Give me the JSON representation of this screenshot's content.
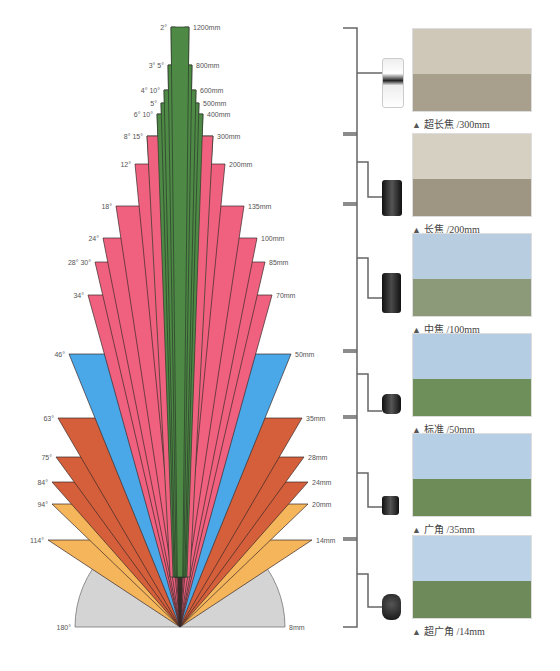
{
  "chart_data": {
    "type": "diagram",
    "origin": [
      180,
      627
    ],
    "groups": [
      {
        "name": "ultra-telephoto",
        "color": "#4e8a45"
      },
      {
        "name": "telephoto",
        "color": "#f0617f"
      },
      {
        "name": "standard",
        "color": "#4aa8e8"
      },
      {
        "name": "wide",
        "color": "#d45f3a"
      },
      {
        "name": "ultra-wide",
        "color": "#f5b55a"
      },
      {
        "name": "fisheye",
        "color": "#d4d4d4"
      }
    ],
    "wedges": [
      {
        "angle_label": "180°",
        "focal": "8mm",
        "y": 627,
        "half_width": 105,
        "color": "#d4d4d4"
      },
      {
        "angle_label": "114°",
        "focal": "14mm",
        "y": 540,
        "half_width": 132,
        "color": "#f5b55a"
      },
      {
        "angle_label": "94°",
        "focal": "20mm",
        "y": 504,
        "half_width": 128,
        "color": "#f5b55a"
      },
      {
        "angle_label": "84°",
        "focal": "24mm",
        "y": 482,
        "half_width": 128,
        "color": "#d45f3a"
      },
      {
        "angle_label": "75°",
        "focal": "28mm",
        "y": 457,
        "half_width": 124,
        "color": "#d45f3a"
      },
      {
        "angle_label": "63°",
        "focal": "35mm",
        "y": 418,
        "half_width": 122,
        "color": "#d45f3a"
      },
      {
        "angle_label": "46°",
        "focal": "50mm",
        "y": 354,
        "half_width": 111,
        "color": "#4aa8e8"
      },
      {
        "angle_label": "34°",
        "focal": "70mm",
        "y": 295,
        "half_width": 92,
        "color": "#f0617f"
      },
      {
        "angle_label": "28° 30°",
        "focal": "85mm",
        "y": 262,
        "half_width": 85,
        "color": "#f0617f"
      },
      {
        "angle_label": "24°",
        "focal": "100mm",
        "y": 238,
        "half_width": 77,
        "color": "#f0617f"
      },
      {
        "angle_label": "18°",
        "focal": "135mm",
        "y": 206,
        "half_width": 64,
        "color": "#f0617f"
      },
      {
        "angle_label": "12°",
        "focal": "200mm",
        "y": 164,
        "half_width": 45,
        "color": "#f0617f"
      },
      {
        "angle_label": "8° 15°",
        "focal": "300mm",
        "y": 136,
        "half_width": 33,
        "color": "#f0617f"
      },
      {
        "angle_label": "6° 10°",
        "focal": "400mm",
        "y": 114,
        "half_width": 23,
        "color": "#4e8a45"
      },
      {
        "angle_label": "5°",
        "focal": "500mm",
        "y": 103,
        "half_width": 19,
        "color": "#4e8a45"
      },
      {
        "angle_label": "4° 10°",
        "focal": "600mm",
        "y": 90,
        "half_width": 16,
        "color": "#4e8a45"
      },
      {
        "angle_label": "3° 5°",
        "focal": "800mm",
        "y": 65,
        "half_width": 12,
        "color": "#4e8a45"
      },
      {
        "angle_label": "2°",
        "focal": "1200mm",
        "y": 27,
        "half_width": 9,
        "color": "#4e8a45"
      }
    ]
  },
  "categories": [
    {
      "caption": "超长焦 /300mm",
      "lens": "white-telephoto-lens",
      "sky": "#cfc8b8",
      "ground": "#a89f8c"
    },
    {
      "caption": "长焦 /200mm",
      "lens": "black-telephoto-lens",
      "sky": "#d6d0c2",
      "ground": "#9e9583"
    },
    {
      "caption": "中焦 /100mm",
      "lens": "black-zoom-lens",
      "sky": "#b9cde0",
      "ground": "#8c9a7a"
    },
    {
      "caption": "标准 /50mm",
      "lens": "prime-lens",
      "sky": "#b5cde3",
      "ground": "#6f8f5a"
    },
    {
      "caption": "广角 /35mm",
      "lens": "wide-prime-lens",
      "sky": "#b7cfe4",
      "ground": "#6e8c58"
    },
    {
      "caption": "超广角 /14mm",
      "lens": "ultra-wide-lens",
      "sky": "#bcd2e6",
      "ground": "#6f8a5a"
    }
  ],
  "triangle_glyph": "▲"
}
